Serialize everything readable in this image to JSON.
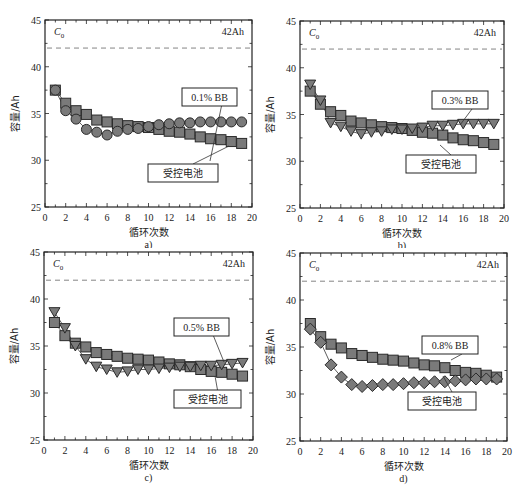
{
  "chart_data": [
    {
      "type": "scatter",
      "panel_label": "a)",
      "xlabel": "循环次数",
      "ylabel": "容量/Ah",
      "xlim": [
        0,
        20
      ],
      "ylim": [
        25,
        45
      ],
      "xticks": [
        0,
        2,
        4,
        6,
        8,
        10,
        12,
        14,
        16,
        18,
        20
      ],
      "yticks": [
        25,
        30,
        35,
        40,
        45
      ],
      "reference_line": {
        "label": "C0",
        "value": 42,
        "value_label": "42Ah",
        "style": "dashed"
      },
      "x": [
        1,
        2,
        3,
        4,
        5,
        6,
        7,
        8,
        9,
        10,
        11,
        12,
        13,
        14,
        15,
        16,
        17,
        18,
        19
      ],
      "series": [
        {
          "name": "受控电池",
          "marker": "square",
          "values": [
            37.5,
            36.1,
            35.3,
            34.9,
            34.3,
            34.1,
            33.9,
            33.7,
            33.6,
            33.5,
            33.3,
            33.1,
            33.0,
            32.8,
            32.5,
            32.3,
            32.2,
            32.0,
            31.8
          ]
        },
        {
          "name": "0.1% BB",
          "marker": "circle",
          "values": [
            37.5,
            35.3,
            34.4,
            33.3,
            33.0,
            32.7,
            33.1,
            33.3,
            33.4,
            33.6,
            33.8,
            33.9,
            34.0,
            34.0,
            34.1,
            34.1,
            34.1,
            34.1,
            34.1
          ]
        }
      ],
      "annotations": [
        "0.1% BB",
        "受控电池"
      ]
    },
    {
      "type": "scatter",
      "panel_label": "b)",
      "xlabel": "循环次数",
      "ylabel": "容量/Ah",
      "xlim": [
        0,
        20
      ],
      "ylim": [
        25,
        45
      ],
      "xticks": [
        0,
        2,
        4,
        6,
        8,
        10,
        12,
        14,
        16,
        18,
        20
      ],
      "yticks": [
        25,
        30,
        35,
        40,
        45
      ],
      "reference_line": {
        "label": "C0",
        "value": 42,
        "value_label": "42Ah",
        "style": "dashed"
      },
      "x": [
        1,
        2,
        3,
        4,
        5,
        6,
        7,
        8,
        9,
        10,
        11,
        12,
        13,
        14,
        15,
        16,
        17,
        18,
        19
      ],
      "series": [
        {
          "name": "受控电池",
          "marker": "square",
          "values": [
            37.5,
            36.1,
            35.3,
            34.9,
            34.3,
            34.1,
            33.9,
            33.7,
            33.6,
            33.5,
            33.3,
            33.1,
            33.0,
            32.8,
            32.5,
            32.3,
            32.2,
            32.0,
            31.8
          ]
        },
        {
          "name": "0.3% BB",
          "marker": "triangle-down",
          "values": [
            38.2,
            36.5,
            34.1,
            33.7,
            33.2,
            32.9,
            33.1,
            33.2,
            33.4,
            33.4,
            33.5,
            33.6,
            33.8,
            33.8,
            33.9,
            34.0,
            34.0,
            34.0,
            34.0
          ]
        }
      ],
      "annotations": [
        "0.3% BB",
        "受控电池"
      ]
    },
    {
      "type": "scatter",
      "panel_label": "c)",
      "xlabel": "循环次数",
      "ylabel": "容量/Ah",
      "xlim": [
        0,
        20
      ],
      "ylim": [
        25,
        45
      ],
      "xticks": [
        0,
        2,
        4,
        6,
        8,
        10,
        12,
        14,
        16,
        18,
        20
      ],
      "yticks": [
        25,
        30,
        35,
        40,
        45
      ],
      "reference_line": {
        "label": "C0",
        "value": 42,
        "value_label": "42Ah",
        "style": "dashed"
      },
      "x": [
        1,
        2,
        3,
        4,
        5,
        6,
        7,
        8,
        9,
        10,
        11,
        12,
        13,
        14,
        15,
        16,
        17,
        18,
        19
      ],
      "series": [
        {
          "name": "受控电池",
          "marker": "square",
          "values": [
            37.5,
            36.1,
            35.3,
            34.9,
            34.3,
            34.1,
            33.9,
            33.7,
            33.6,
            33.5,
            33.3,
            33.1,
            33.0,
            32.8,
            32.5,
            32.3,
            32.2,
            32.0,
            31.8
          ]
        },
        {
          "name": "0.5% BB",
          "marker": "triangle-down",
          "values": [
            38.6,
            36.9,
            35.0,
            33.6,
            32.8,
            32.5,
            32.2,
            32.3,
            32.5,
            32.5,
            32.6,
            32.7,
            32.8,
            32.8,
            32.9,
            32.9,
            33.0,
            33.1,
            33.2
          ]
        }
      ],
      "annotations": [
        "0.5% BB",
        "受控电池"
      ]
    },
    {
      "type": "scatter",
      "panel_label": "d)",
      "xlabel": "循环次数",
      "ylabel": "容量/Ah",
      "xlim": [
        0,
        20
      ],
      "ylim": [
        25,
        45
      ],
      "xticks": [
        0,
        2,
        4,
        6,
        8,
        10,
        12,
        14,
        16,
        18,
        20
      ],
      "yticks": [
        25,
        30,
        35,
        40,
        45
      ],
      "reference_line": {
        "label": "C0",
        "value": 42,
        "value_label": "42Ah",
        "style": "dashed"
      },
      "x": [
        1,
        2,
        3,
        4,
        5,
        6,
        7,
        8,
        9,
        10,
        11,
        12,
        13,
        14,
        15,
        16,
        17,
        18,
        19
      ],
      "series": [
        {
          "name": "受控电池",
          "marker": "square",
          "values": [
            37.5,
            36.1,
            35.3,
            34.9,
            34.3,
            34.1,
            33.9,
            33.7,
            33.6,
            33.5,
            33.3,
            33.1,
            33.0,
            32.8,
            32.5,
            32.3,
            32.2,
            32.0,
            31.8
          ]
        },
        {
          "name": "0.8% BB",
          "marker": "diamond",
          "values": [
            36.9,
            35.5,
            33.1,
            31.8,
            31.0,
            30.8,
            30.9,
            31.0,
            31.0,
            31.1,
            31.2,
            31.2,
            31.3,
            31.3,
            31.4,
            31.5,
            31.6,
            31.6,
            31.6
          ]
        }
      ],
      "annotations": [
        "0.8% BB",
        "受控电池"
      ]
    }
  ],
  "colors": {
    "marker_fill": "#7a7a7a",
    "marker_stroke": "#2a2a2a",
    "axis": "#222222",
    "dashed_line": "#777777"
  },
  "panels": [
    {
      "label": "a)",
      "bb_label": "0.1% BB",
      "ctrl_label": "受控电池",
      "c0": "C",
      "c0_sub": "0",
      "ref": "42Ah",
      "xlabel": "循环次数",
      "ylabel": "容量/Ah"
    },
    {
      "label": "b)",
      "bb_label": "0.3% BB",
      "ctrl_label": "受控电池",
      "c0": "C",
      "c0_sub": "0",
      "ref": "42Ah",
      "xlabel": "循环次数",
      "ylabel": "容量/Ah"
    },
    {
      "label": "c)",
      "bb_label": "0.5% BB",
      "ctrl_label": "受控电池",
      "c0": "C",
      "c0_sub": "0",
      "ref": "42Ah",
      "xlabel": "循环次数",
      "ylabel": "容量/Ah"
    },
    {
      "label": "d)",
      "bb_label": "0.8% BB",
      "ctrl_label": "受控电池",
      "c0": "C",
      "c0_sub": "0",
      "ref": "42Ah",
      "xlabel": "循环次数",
      "ylabel": "容量/Ah"
    }
  ]
}
